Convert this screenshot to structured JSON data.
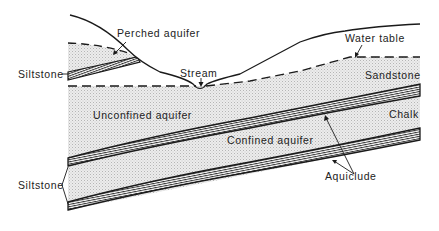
{
  "diagram": {
    "type": "geological cross-section",
    "labels": {
      "perched_aquifer": "Perched aquifer",
      "stream": "Stream",
      "water_table": "Water table",
      "siltstone_top": "Siltstone",
      "sandstone": "Sandstone",
      "unconfined_aquifer": "Unconfined aquifer",
      "chalk": "Chalk",
      "confined_aquifer": "Confined aquifer",
      "aquiclude": "Aquiclude",
      "siltstone_bottom": "Siltstone"
    },
    "colors": {
      "line": "#1a1a1a",
      "stipple_bg": "#e6e6e6",
      "stipple_dot": "#b8b8b8",
      "background": "#ffffff"
    }
  }
}
